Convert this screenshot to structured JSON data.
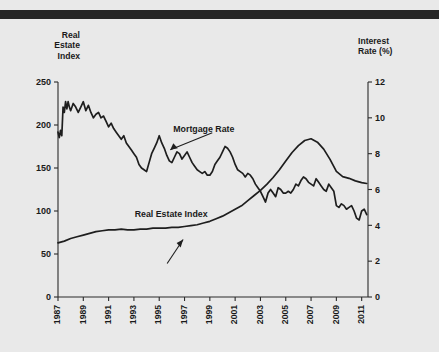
{
  "figure": {
    "background_color": "#e9e9e9",
    "top_bar_color": "#262626",
    "line_color": "#1e1e1e"
  },
  "left_axis_title": "Real\nEstate\nIndex",
  "right_axis_title": "Interest\nRate (%)",
  "chart_data": {
    "type": "line",
    "title": "",
    "subtitle": "",
    "xlabel": "",
    "ylabel": "Real Estate Index",
    "y2label": "Interest Rate (%)",
    "grid": false,
    "legend_position": "inline-annotation",
    "xlim": [
      1987,
      2011.5
    ],
    "ylim": [
      0,
      250
    ],
    "y2lim": [
      0,
      12
    ],
    "yticks": [
      0,
      50,
      100,
      150,
      200,
      250
    ],
    "y2ticks": [
      0,
      2,
      4,
      6,
      8,
      10,
      12
    ],
    "xticks": [
      1987,
      1989,
      1991,
      1993,
      1995,
      1997,
      1999,
      2001,
      2003,
      2005,
      2007,
      2009,
      2011
    ],
    "xtick_labels": [
      "1987",
      "1989",
      "1991",
      "1993",
      "1995",
      "1997",
      "1999",
      "2001",
      "2003",
      "2005",
      "2007",
      "2009",
      "2011"
    ],
    "xtick_rotation": 90,
    "annotations": [
      {
        "text": "Mortgage Rate",
        "target_series": "Mortgage Rate",
        "x": 1995.4,
        "y2": 8.0
      },
      {
        "text": "Real Estate Index",
        "target_series": "Real Estate Index",
        "x": 1996.1,
        "y": 75
      }
    ],
    "series": [
      {
        "name": "Mortgage Rate",
        "axis": "right",
        "units": "percent",
        "x": [
          1987.0,
          1987.1,
          1987.2,
          1987.3,
          1987.4,
          1987.5,
          1987.6,
          1987.7,
          1987.8,
          1987.9,
          1988.0,
          1988.2,
          1988.4,
          1988.6,
          1988.8,
          1989.0,
          1989.2,
          1989.4,
          1989.6,
          1989.8,
          1990.0,
          1990.2,
          1990.4,
          1990.6,
          1990.8,
          1991.0,
          1991.2,
          1991.4,
          1991.6,
          1991.8,
          1992.0,
          1992.2,
          1992.4,
          1992.6,
          1992.8,
          1993.0,
          1993.2,
          1993.4,
          1993.6,
          1993.8,
          1994.0,
          1994.2,
          1994.4,
          1994.6,
          1994.8,
          1995.0,
          1995.2,
          1995.4,
          1995.6,
          1995.8,
          1996.0,
          1996.2,
          1996.4,
          1996.6,
          1996.8,
          1997.0,
          1997.2,
          1997.4,
          1997.6,
          1997.8,
          1998.0,
          1998.2,
          1998.4,
          1998.6,
          1998.8,
          1999.0,
          1999.2,
          1999.4,
          1999.6,
          1999.8,
          2000.0,
          2000.2,
          2000.4,
          2000.6,
          2000.8,
          2001.0,
          2001.2,
          2001.4,
          2001.6,
          2001.8,
          2002.0,
          2002.2,
          2002.4,
          2002.6,
          2002.8,
          2003.0,
          2003.2,
          2003.4,
          2003.6,
          2003.8,
          2004.0,
          2004.2,
          2004.4,
          2004.6,
          2004.8,
          2005.0,
          2005.2,
          2005.4,
          2005.6,
          2005.8,
          2006.0,
          2006.2,
          2006.4,
          2006.6,
          2006.8,
          2007.0,
          2007.2,
          2007.4,
          2007.6,
          2007.8,
          2008.0,
          2008.2,
          2008.4,
          2008.6,
          2008.8,
          2009.0,
          2009.2,
          2009.4,
          2009.6,
          2009.8,
          2010.0,
          2010.2,
          2010.4,
          2010.6,
          2010.8,
          2011.0,
          2011.2,
          2011.4
        ],
        "values": [
          9.2,
          8.9,
          9.3,
          9.0,
          10.6,
          10.3,
          10.9,
          10.5,
          10.9,
          10.6,
          10.4,
          10.8,
          10.6,
          10.3,
          10.6,
          10.9,
          10.4,
          10.7,
          10.3,
          10.0,
          10.2,
          10.3,
          10.0,
          10.1,
          9.8,
          9.5,
          9.7,
          9.4,
          9.2,
          9.0,
          8.8,
          9.0,
          8.6,
          8.4,
          8.2,
          8.0,
          7.8,
          7.4,
          7.2,
          7.1,
          7.0,
          7.5,
          8.0,
          8.3,
          8.6,
          9.0,
          8.6,
          8.3,
          7.9,
          7.6,
          7.5,
          7.8,
          8.1,
          8.0,
          7.7,
          7.9,
          8.1,
          7.8,
          7.5,
          7.3,
          7.1,
          7.0,
          6.9,
          7.0,
          6.8,
          6.8,
          7.0,
          7.4,
          7.6,
          7.8,
          8.1,
          8.4,
          8.3,
          8.1,
          7.8,
          7.4,
          7.1,
          7.0,
          6.9,
          6.7,
          6.9,
          6.8,
          6.6,
          6.3,
          6.1,
          5.9,
          5.6,
          5.3,
          5.8,
          6.0,
          5.8,
          5.6,
          6.1,
          6.0,
          5.8,
          5.8,
          5.9,
          5.8,
          6.0,
          6.3,
          6.2,
          6.5,
          6.7,
          6.6,
          6.4,
          6.3,
          6.2,
          6.6,
          6.4,
          6.2,
          6.0,
          5.9,
          6.3,
          6.1,
          5.9,
          5.1,
          5.0,
          5.2,
          5.1,
          4.9,
          5.0,
          5.1,
          4.8,
          4.4,
          4.3,
          4.8,
          4.9,
          4.6
        ]
      },
      {
        "name": "Real Estate Index",
        "axis": "left",
        "units": "index",
        "x": [
          1987.0,
          1987.5,
          1988.0,
          1988.5,
          1989.0,
          1989.5,
          1990.0,
          1990.5,
          1991.0,
          1991.5,
          1992.0,
          1992.5,
          1993.0,
          1993.5,
          1994.0,
          1994.5,
          1995.0,
          1995.5,
          1996.0,
          1996.5,
          1997.0,
          1997.5,
          1998.0,
          1998.5,
          1999.0,
          1999.5,
          2000.0,
          2000.5,
          2001.0,
          2001.5,
          2002.0,
          2002.5,
          2003.0,
          2003.5,
          2004.0,
          2004.5,
          2005.0,
          2005.5,
          2006.0,
          2006.5,
          2007.0,
          2007.5,
          2008.0,
          2008.5,
          2009.0,
          2009.5,
          2010.0,
          2010.5,
          2011.0,
          2011.4
        ],
        "values": [
          63,
          65,
          68,
          70,
          72,
          74,
          76,
          77,
          78,
          78,
          79,
          78,
          78,
          79,
          79,
          80,
          80,
          80,
          81,
          81,
          82,
          83,
          84,
          86,
          88,
          91,
          94,
          98,
          102,
          106,
          112,
          118,
          124,
          131,
          139,
          148,
          158,
          168,
          176,
          182,
          184,
          180,
          172,
          160,
          146,
          140,
          138,
          135,
          133,
          132
        ]
      }
    ]
  }
}
